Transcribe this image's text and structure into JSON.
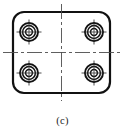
{
  "figure": {
    "caption": "(c)",
    "kind": "engineering-drawing",
    "view": "top-view",
    "colors": {
      "outline": "#111111",
      "centerline": "#4d4d4d",
      "background": "#ffffff",
      "caption": "#1a1a1a"
    },
    "plate": {
      "x": 13,
      "y": 12,
      "width": 97,
      "height": 81,
      "corner_radius": 11,
      "outline_width": 2.2
    },
    "centerlines": {
      "vertical": {
        "x": 61.5,
        "y1": 4,
        "y2": 101
      },
      "horizontal": {
        "y": 52.5,
        "x1": 3,
        "x2": 121
      },
      "dash_pattern": "14 3 3 3",
      "stroke_width": 0.9
    },
    "holes": [
      {
        "name": "hole-top-left",
        "cx": 29,
        "cy": 32,
        "r_outer": 9.0,
        "r_mid": 6.4,
        "r_inner": 3.4,
        "tick": 12.5
      },
      {
        "name": "hole-top-right",
        "cx": 94,
        "cy": 32,
        "r_outer": 9.0,
        "r_mid": 6.4,
        "r_inner": 3.4,
        "tick": 12.5
      },
      {
        "name": "hole-bottom-left",
        "cx": 29,
        "cy": 73,
        "r_outer": 9.0,
        "r_mid": 6.4,
        "r_inner": 3.4,
        "tick": 12.5
      },
      {
        "name": "hole-bottom-right",
        "cx": 94,
        "cy": 73,
        "r_outer": 9.0,
        "r_mid": 6.4,
        "r_inner": 3.4,
        "tick": 12.5
      }
    ],
    "hole_line_widths": {
      "outer": 1.9,
      "mid": 1.5,
      "inner": 1.5,
      "crosshair": 0.9
    }
  }
}
